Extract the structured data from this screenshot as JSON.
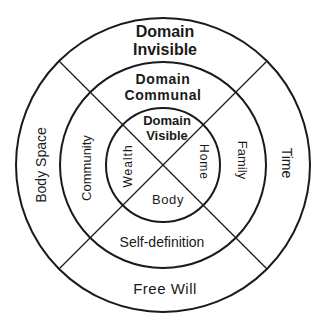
{
  "diagram": {
    "background": "#ffffff",
    "stroke_color": "#1a1a1a",
    "center": {
      "x": 163,
      "y": 165
    },
    "rings": {
      "outer_radius": 147,
      "middle_radius": 103,
      "inner_radius": 57
    },
    "outer_ring": {
      "top_title_line1": "Domain",
      "top_title_line2": "Invisible",
      "left": "Body Space",
      "right": "Time",
      "bottom": "Free Will"
    },
    "middle_ring": {
      "top_title_line1": "Domain",
      "top_title_line2": "Communal",
      "left": "Community",
      "right": "Family",
      "bottom": "Self-definition"
    },
    "inner_ring": {
      "top_title_line1": "Domain",
      "top_title_line2": "Visible",
      "left": "Wealth",
      "right": "Home",
      "bottom": "Body"
    }
  }
}
